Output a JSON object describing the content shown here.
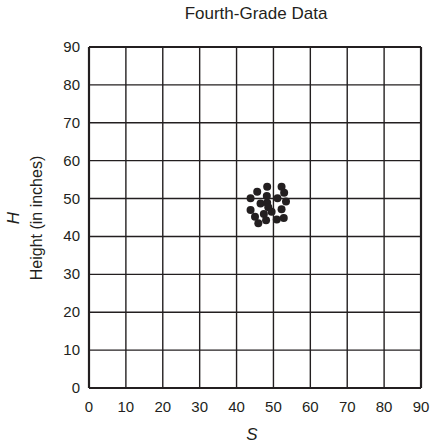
{
  "chart_data": {
    "type": "scatter",
    "title": "Fourth-Grade Data",
    "xlabel": "S",
    "ylabel_symbol": "H",
    "ylabel": "Height (in inches)",
    "xlim": [
      0,
      90
    ],
    "ylim": [
      0,
      90
    ],
    "x_ticks": [
      0,
      10,
      20,
      30,
      40,
      50,
      60,
      70,
      80,
      90
    ],
    "y_ticks": [
      0,
      10,
      20,
      30,
      40,
      50,
      60,
      70,
      80,
      90
    ],
    "grid": true,
    "legend": null,
    "series": [
      {
        "name": "Fourth-Grade Students",
        "points": [
          [
            48.3,
            53.1
          ],
          [
            52.2,
            53.1
          ],
          [
            52.9,
            51.5
          ],
          [
            45.6,
            51.8
          ],
          [
            43.8,
            50.1
          ],
          [
            48.2,
            50.7
          ],
          [
            51.1,
            50.1
          ],
          [
            53.4,
            49.2
          ],
          [
            46.5,
            48.7
          ],
          [
            48.3,
            48.9
          ],
          [
            48.6,
            47.7
          ],
          [
            43.8,
            47.0
          ],
          [
            49.5,
            46.5
          ],
          [
            52.2,
            47.2
          ],
          [
            47.4,
            45.9
          ],
          [
            45.0,
            45.2
          ],
          [
            48.0,
            44.3
          ],
          [
            50.9,
            44.5
          ],
          [
            52.8,
            44.9
          ],
          [
            45.9,
            43.5
          ]
        ]
      }
    ]
  },
  "colors": {
    "ink": "#231f20",
    "grid": "#231f20",
    "background": "#ffffff"
  }
}
